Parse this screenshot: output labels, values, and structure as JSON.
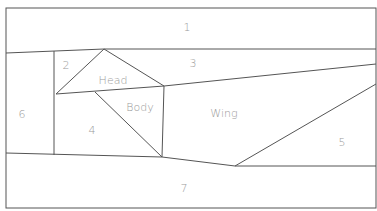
{
  "diagram": {
    "type": "segmentation-layout",
    "stroke_color": "#555555",
    "label_color": "#9a9a9a",
    "regions": [
      {
        "id": "1",
        "label": "1",
        "x": 187,
        "y": 27
      },
      {
        "id": "2",
        "label": "2",
        "x": 66,
        "y": 65
      },
      {
        "id": "3",
        "label": "3",
        "x": 193,
        "y": 63
      },
      {
        "id": "head",
        "label": "Head",
        "x": 113,
        "y": 80
      },
      {
        "id": "6",
        "label": "6",
        "x": 22,
        "y": 114
      },
      {
        "id": "body",
        "label": "Body",
        "x": 140,
        "y": 107
      },
      {
        "id": "wing",
        "label": "Wing",
        "x": 224,
        "y": 113
      },
      {
        "id": "4",
        "label": "4",
        "x": 92,
        "y": 130
      },
      {
        "id": "5",
        "label": "5",
        "x": 342,
        "y": 142
      },
      {
        "id": "7",
        "label": "7",
        "x": 184,
        "y": 188
      }
    ]
  }
}
